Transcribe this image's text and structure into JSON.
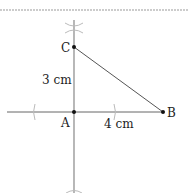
{
  "diagram": {
    "type": "geometric-construction",
    "points": {
      "A": {
        "label": "A",
        "x": 74,
        "y": 112
      },
      "B": {
        "label": "B",
        "x": 163,
        "y": 112
      },
      "C": {
        "label": "C",
        "x": 74,
        "y": 47
      }
    },
    "measurements": {
      "AC": "3 cm",
      "AB": "4 cm"
    },
    "colors": {
      "line": "#555555",
      "construction": "#aaaaaa",
      "point": "#111111",
      "text": "#222222"
    }
  }
}
